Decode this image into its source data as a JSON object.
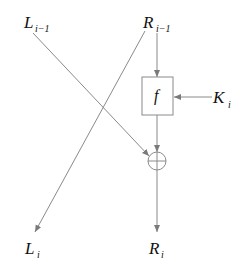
{
  "diagram": {
    "type": "feistel-round",
    "inputs": {
      "left": {
        "base": "L",
        "sub": "i−1"
      },
      "right": {
        "base": "R",
        "sub": "i−1"
      }
    },
    "key": {
      "base": "K",
      "sub": "i"
    },
    "function_label": "f",
    "xor_symbol": "⊕",
    "outputs": {
      "left": {
        "base": "L",
        "sub": "i"
      },
      "right": {
        "base": "R",
        "sub": "i"
      }
    },
    "edges": [
      {
        "from": "R_i-1",
        "to": "f"
      },
      {
        "from": "K_i",
        "to": "f"
      },
      {
        "from": "f",
        "to": "xor"
      },
      {
        "from": "L_i-1",
        "to": "xor"
      },
      {
        "from": "xor",
        "to": "R_i"
      },
      {
        "from": "R_i-1",
        "to": "L_i"
      }
    ],
    "colors": {
      "line": "#8a8a8a",
      "text": "#111111"
    }
  }
}
